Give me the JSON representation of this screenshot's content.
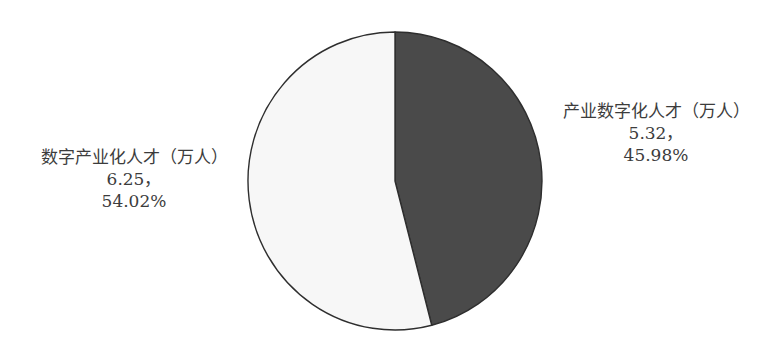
{
  "chart_data": {
    "type": "pie",
    "title": "",
    "unit": "万人",
    "slices": [
      {
        "name": "产业数字化人才（万人）",
        "value": 5.32,
        "value_label": "5.32，",
        "percent": 45.98,
        "percent_label": "45.98%",
        "color": "#4a4a4a"
      },
      {
        "name": "数字产业化人才（万人）",
        "value": 6.25,
        "value_label": "6.25，",
        "percent": 54.02,
        "percent_label": "54.02%",
        "color": "#f7f7f7"
      }
    ],
    "start_angle_deg": 0,
    "direction": "clockwise",
    "legend": "none",
    "labels_outside": true
  },
  "labels": {
    "right": {
      "name": "产业数字化人才（万人）",
      "value": "5.32，",
      "percent": "45.98%"
    },
    "left": {
      "name": "数字产业化人才（万人）",
      "value": "6.25，",
      "percent": "54.02%"
    }
  }
}
